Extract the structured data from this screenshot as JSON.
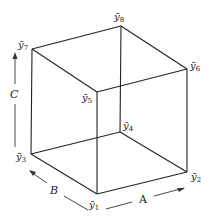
{
  "diagram": {
    "type": "cube",
    "vertices": [
      {
        "id": "y1",
        "symbol": "ȳ",
        "sub": "1",
        "x": 97,
        "y": 194,
        "lx": 89,
        "ly": 208
      },
      {
        "id": "y2",
        "symbol": "ȳ",
        "sub": "2",
        "x": 187,
        "y": 172,
        "lx": 191,
        "ly": 180
      },
      {
        "id": "y3",
        "symbol": "ȳ",
        "sub": "3",
        "x": 31,
        "y": 154,
        "lx": 16,
        "ly": 160
      },
      {
        "id": "y4",
        "symbol": "ȳ",
        "sub": "4",
        "x": 120,
        "y": 132,
        "lx": 123,
        "ly": 129
      },
      {
        "id": "y5",
        "symbol": "ȳ",
        "sub": "5",
        "x": 97,
        "y": 92,
        "lx": 82,
        "ly": 101
      },
      {
        "id": "y6",
        "symbol": "ȳ",
        "sub": "6",
        "x": 187,
        "y": 69,
        "lx": 190,
        "ly": 69
      },
      {
        "id": "y7",
        "symbol": "ȳ",
        "sub": "7",
        "x": 32,
        "y": 49,
        "lx": 19,
        "ly": 47
      },
      {
        "id": "y8",
        "symbol": "ȳ",
        "sub": "8",
        "x": 121,
        "y": 26,
        "lx": 115,
        "ly": 20
      }
    ],
    "edges": [
      [
        "y1",
        "y2"
      ],
      [
        "y1",
        "y3"
      ],
      [
        "y2",
        "y4"
      ],
      [
        "y3",
        "y4"
      ],
      [
        "y5",
        "y6"
      ],
      [
        "y5",
        "y7"
      ],
      [
        "y6",
        "y8"
      ],
      [
        "y7",
        "y8"
      ],
      [
        "y1",
        "y5"
      ],
      [
        "y2",
        "y6"
      ],
      [
        "y3",
        "y7"
      ],
      [
        "y4",
        "y8"
      ]
    ],
    "axes": [
      {
        "label": "A",
        "x": 140,
        "y": 203
      },
      {
        "label": "B",
        "x": 51,
        "y": 193
      },
      {
        "label": "C",
        "x": 11,
        "y": 98
      }
    ]
  }
}
